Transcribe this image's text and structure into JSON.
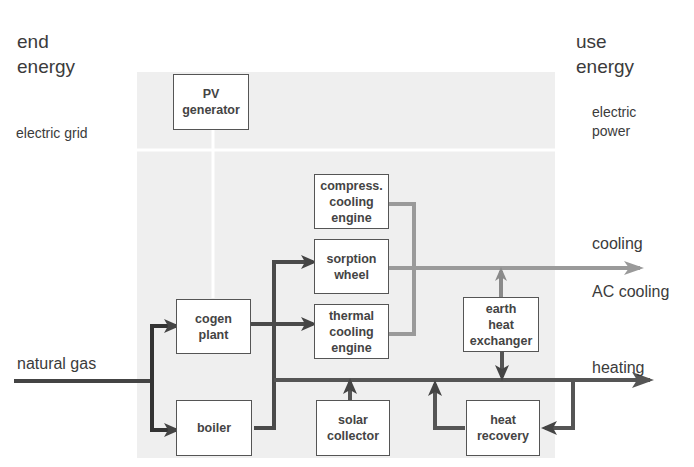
{
  "headings": {
    "left_line1": "end",
    "left_line2": "energy",
    "right_line1": "use",
    "right_line2": "energy"
  },
  "inputs": {
    "electric_grid": "electric grid",
    "natural_gas": "natural gas"
  },
  "outputs": {
    "electric_power_line1": "electric",
    "electric_power_line2": "power",
    "cooling": "cooling",
    "ac_cooling": "AC cooling",
    "heating": "heating"
  },
  "components": {
    "pv_generator": [
      "PV",
      "generator"
    ],
    "cogen_plant": [
      "cogen",
      "plant"
    ],
    "boiler": [
      "boiler"
    ],
    "compress_cooling_engine": [
      "compress.",
      "cooling",
      "engine"
    ],
    "sorption_wheel": [
      "sorption",
      "wheel"
    ],
    "thermal_cooling_engine": [
      "thermal",
      "cooling",
      "engine"
    ],
    "solar_collector": [
      "solar",
      "collector"
    ],
    "earth_heat_exchanger": [
      "earth",
      "heat",
      "exchanger"
    ],
    "heat_recovery": [
      "heat",
      "recovery"
    ]
  },
  "colors": {
    "heat_flow": "#555555",
    "cooling_flow": "#999999",
    "electric_flow": "#ffffff",
    "panel": "#efefef"
  }
}
